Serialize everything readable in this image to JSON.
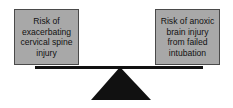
{
  "diagram": {
    "type": "balance-scale",
    "left": {
      "label": "Risk of exacerbating cervical spine injury"
    },
    "right": {
      "label": "Risk of anoxic brain injury from failed intubation"
    },
    "colors": {
      "box_fill": "#a8a8a8",
      "beam": "#111111",
      "fulcrum": "#111111"
    }
  }
}
